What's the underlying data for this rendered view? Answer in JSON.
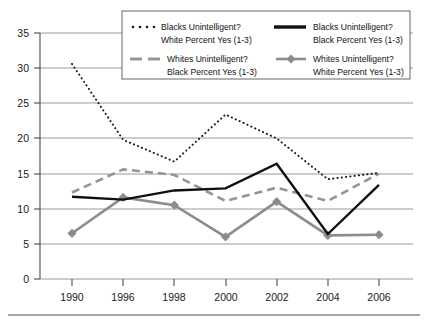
{
  "chart_data": {
    "type": "line",
    "title": "",
    "xlabel": "",
    "ylabel": "",
    "x": [
      1990,
      1996,
      1998,
      2000,
      2002,
      2004,
      2006
    ],
    "categories": [
      "1990",
      "1996",
      "1998",
      "2000",
      "2002",
      "2004",
      "2006"
    ],
    "ylim": [
      0,
      35
    ],
    "yticks": [
      0,
      5,
      10,
      15,
      20,
      25,
      30,
      35
    ],
    "ytick_labels": [
      "0",
      "5",
      "10",
      "15",
      "20",
      "25",
      "30",
      "35"
    ],
    "grid": true,
    "legend_position": "top-center",
    "series": [
      {
        "name": "Blacks Unintelligent? White Percent Yes (1-3)",
        "style": "dotted",
        "color": "#1a1a1a",
        "values": [
          30.6,
          19.8,
          16.7,
          23.4,
          20.0,
          14.2,
          15.1
        ]
      },
      {
        "name": "Blacks Unintelligent? Black Percent Yes (1-3)",
        "style": "solid",
        "color": "#101010",
        "values": [
          11.7,
          11.3,
          12.6,
          12.9,
          16.4,
          6.4,
          13.4
        ]
      },
      {
        "name": "Whites Unintelligent? Black Percent Yes (1-3)",
        "style": "dashed",
        "color": "#959595",
        "values": [
          12.3,
          15.6,
          14.8,
          11.1,
          13.0,
          11.1,
          15.0
        ]
      },
      {
        "name": "Whites Unintelligent? White Percent Yes (1-3)",
        "style": "marker-line",
        "color": "#8c8c8c",
        "values": [
          6.5,
          11.6,
          10.5,
          6.0,
          11.0,
          6.2,
          6.3
        ]
      }
    ]
  },
  "legend": {
    "entries": [
      {
        "line1": "Blacks Unintelligent?",
        "line2": "White Percent Yes (1-3)",
        "swatch": "dotted-swatch-icon"
      },
      {
        "line1": "Blacks Unintelligent?",
        "line2": "Black Percent Yes (1-3)",
        "swatch": "solid-swatch-icon"
      },
      {
        "line1": "Whites Unintelligent?",
        "line2": "Black Percent Yes (1-3)",
        "swatch": "dashed-swatch-icon"
      },
      {
        "line1": "Whites Unintelligent?",
        "line2": "White Percent Yes (1-3)",
        "swatch": "marker-swatch-icon"
      }
    ]
  }
}
